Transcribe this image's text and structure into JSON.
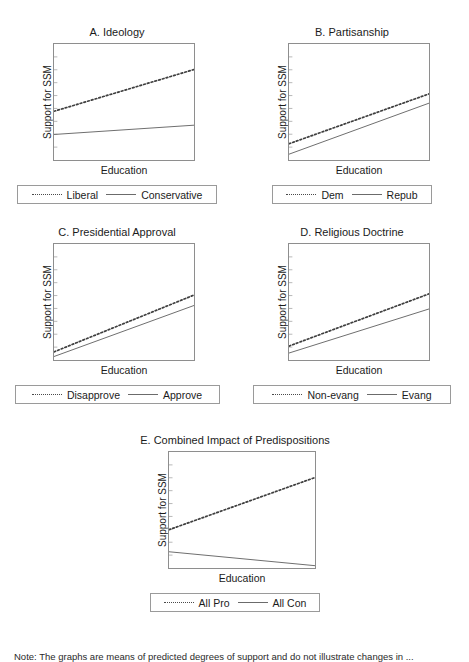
{
  "figure": {
    "axis_ylabel": "Support for SSM",
    "axis_xlabel": "Education",
    "note": "Note: The graphs are means of predicted degrees of support and do not illustrate changes in ..."
  },
  "panels": {
    "a": {
      "title": "A. Ideology",
      "legend": {
        "dotted": "Liberal",
        "solid": "Conservative"
      }
    },
    "b": {
      "title": "B. Partisanship",
      "legend": {
        "dotted": "Dem",
        "solid": "Repub"
      }
    },
    "c": {
      "title": "C. Presidential Approval",
      "legend": {
        "dotted": "Disapprove",
        "solid": "Approve"
      }
    },
    "d": {
      "title": "D. Religious Doctrine",
      "legend": {
        "dotted": "Non-evang",
        "solid": "Evang"
      }
    },
    "e": {
      "title": "E. Combined Impact of Predispositions",
      "legend": {
        "dotted": "All Pro",
        "solid": "All Con"
      }
    }
  },
  "chart_data": [
    {
      "id": "a",
      "type": "line",
      "title": "A. Ideology",
      "xlabel": "Education",
      "ylabel": "Support for SSM",
      "xlim": [
        0,
        1
      ],
      "ylim": [
        0,
        1
      ],
      "grid": false,
      "legend_position": "below",
      "x": [
        0,
        1
      ],
      "series": [
        {
          "name": "Liberal",
          "style": "dotted",
          "values": [
            0.42,
            0.78
          ]
        },
        {
          "name": "Conservative",
          "style": "solid",
          "values": [
            0.22,
            0.3
          ]
        }
      ]
    },
    {
      "id": "b",
      "type": "line",
      "title": "B. Partisanship",
      "xlabel": "Education",
      "ylabel": "Support for SSM",
      "xlim": [
        0,
        1
      ],
      "ylim": [
        0,
        1
      ],
      "grid": false,
      "legend_position": "below",
      "x": [
        0,
        1
      ],
      "series": [
        {
          "name": "Dem",
          "style": "dotted",
          "values": [
            0.14,
            0.57
          ]
        },
        {
          "name": "Repub",
          "style": "solid",
          "values": [
            0.05,
            0.49
          ]
        }
      ]
    },
    {
      "id": "c",
      "type": "line",
      "title": "C. Presidential Approval",
      "xlabel": "Education",
      "ylabel": "Support for SSM",
      "xlim": [
        0,
        1
      ],
      "ylim": [
        0,
        1
      ],
      "grid": false,
      "legend_position": "below",
      "x": [
        0,
        1
      ],
      "series": [
        {
          "name": "Disapprove",
          "style": "dotted",
          "values": [
            0.07,
            0.56
          ]
        },
        {
          "name": "Approve",
          "style": "solid",
          "values": [
            0.03,
            0.47
          ]
        }
      ]
    },
    {
      "id": "d",
      "type": "line",
      "title": "D. Religious Doctrine",
      "xlabel": "Education",
      "ylabel": "Support for SSM",
      "xlim": [
        0,
        1
      ],
      "ylim": [
        0,
        1
      ],
      "grid": false,
      "legend_position": "below",
      "x": [
        0,
        1
      ],
      "series": [
        {
          "name": "Non-evang",
          "style": "dotted",
          "values": [
            0.12,
            0.57
          ]
        },
        {
          "name": "Evang",
          "style": "solid",
          "values": [
            0.06,
            0.44
          ]
        }
      ]
    },
    {
      "id": "e",
      "type": "line",
      "title": "E. Combined Impact of Predispositions",
      "xlabel": "Education",
      "ylabel": "Support for SSM",
      "xlim": [
        0,
        1
      ],
      "ylim": [
        0,
        1
      ],
      "grid": false,
      "legend_position": "below",
      "x": [
        0,
        1
      ],
      "series": [
        {
          "name": "All Pro",
          "style": "dotted",
          "values": [
            0.33,
            0.78
          ]
        },
        {
          "name": "All Con",
          "style": "solid",
          "values": [
            0.14,
            0.02
          ]
        }
      ]
    }
  ]
}
